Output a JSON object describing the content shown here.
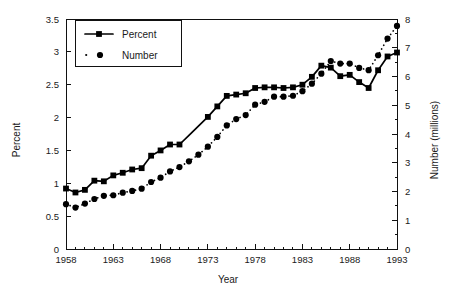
{
  "chart_data": {
    "type": "line",
    "title": "",
    "xlabel": "Year",
    "ylabel": "Percent",
    "y2label": "Number (millions)",
    "grid": false,
    "legend_position": "top-left-inside",
    "xlim": [
      1958,
      1993
    ],
    "ylim": [
      0,
      3.5
    ],
    "y2lim": [
      0,
      8
    ],
    "xticks": [
      1958,
      1963,
      1968,
      1973,
      1978,
      1983,
      1988,
      1993
    ],
    "xtick_labels": [
      "1958",
      "1963",
      "1968",
      "1973",
      "1978",
      "1983",
      "1988",
      "1993"
    ],
    "xminor_step": 1,
    "yticks": [
      0,
      0.5,
      1,
      1.5,
      2,
      2.5,
      3,
      3.5
    ],
    "ytick_labels": [
      "0",
      "0.5",
      "1",
      "1.5",
      "2",
      "2.5",
      "3",
      "3.5"
    ],
    "y2ticks": [
      0,
      1,
      2,
      3,
      4,
      5,
      6,
      7,
      8
    ],
    "y2tick_labels": [
      "0",
      "1",
      "2",
      "3",
      "4",
      "5",
      "6",
      "7",
      "8"
    ],
    "y2minor_step": 0.5,
    "x": [
      1958,
      1959,
      1960,
      1961,
      1962,
      1963,
      1964,
      1965,
      1966,
      1967,
      1968,
      1969,
      1970,
      1971,
      1972,
      1973,
      1974,
      1975,
      1976,
      1977,
      1978,
      1979,
      1980,
      1981,
      1982,
      1983,
      1984,
      1985,
      1986,
      1987,
      1988,
      1989,
      1990,
      1991,
      1992,
      1993
    ],
    "series": [
      {
        "name": "Percent",
        "axis": "left",
        "units": "percent",
        "marker": "square",
        "linestyle": "solid",
        "color": "#000000",
        "values": [
          0.92,
          0.86,
          0.9,
          1.04,
          1.03,
          1.12,
          1.16,
          1.21,
          1.23,
          1.42,
          1.5,
          1.59,
          1.59,
          1.73,
          1.87,
          2.01,
          2.17,
          2.33,
          2.35,
          2.37,
          2.45,
          2.46,
          2.46,
          2.45,
          2.46,
          2.5,
          2.62,
          2.79,
          2.76,
          2.63,
          2.65,
          2.54,
          2.45,
          2.72,
          2.93,
          2.99
        ],
        "marker_gaps": [
          1971,
          1972
        ]
      },
      {
        "name": "Number",
        "axis": "right",
        "units": "millions",
        "marker": "circle",
        "linestyle": "dotted",
        "color": "#000000",
        "values": [
          1.56,
          1.44,
          1.58,
          1.74,
          1.85,
          1.87,
          1.96,
          2.02,
          2.1,
          2.33,
          2.48,
          2.7,
          2.85,
          3.05,
          3.28,
          3.56,
          3.9,
          4.3,
          4.52,
          4.66,
          5.02,
          5.12,
          5.3,
          5.3,
          5.33,
          5.49,
          5.75,
          6.1,
          6.54,
          6.45,
          6.45,
          6.3,
          6.22,
          6.74,
          7.32,
          7.76
        ]
      }
    ],
    "legend": [
      {
        "label": "Percent",
        "marker": "square",
        "linestyle": "solid"
      },
      {
        "label": "Number",
        "marker": "circle",
        "linestyle": "dotted"
      }
    ]
  }
}
